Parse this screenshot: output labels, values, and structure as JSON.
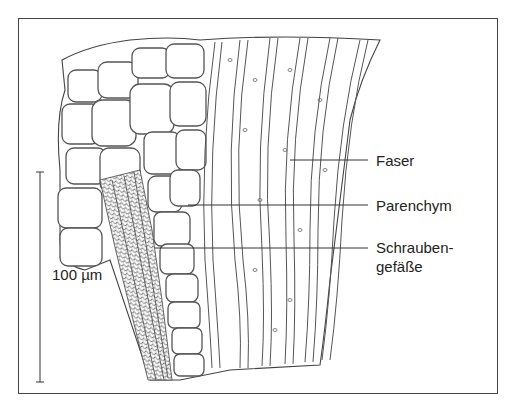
{
  "figure": {
    "title": "",
    "labels": [
      {
        "id": "faser",
        "text": "Faser"
      },
      {
        "id": "parenchym",
        "text": "Parenchym"
      },
      {
        "id": "schraubengefaesse_line1",
        "text": "Schrauben-"
      },
      {
        "id": "schraubengefaesse_line2",
        "text": "gefäße"
      }
    ],
    "scale_bar": {
      "text": "100 µm"
    },
    "colors": {
      "line": "#333333",
      "background": "#ffffff",
      "frame": "#444444"
    }
  }
}
